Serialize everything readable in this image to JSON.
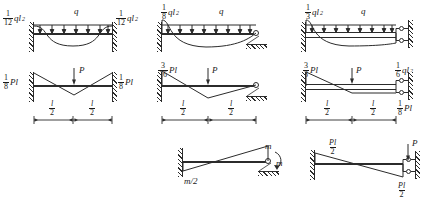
{
  "figure": {
    "ink_color": "#2b2b2b",
    "background": "#ffffff"
  },
  "panels": [
    {
      "id": "p1",
      "name": "fixed-fixed-udl",
      "support_left": "fixed-wall",
      "support_right": "fixed-wall",
      "load": {
        "symbol": "q",
        "type": "uniform-distributed"
      },
      "labels": {
        "left_moment": {
          "num": "1",
          "den": "12",
          "sym": "ql",
          "exp": "2"
        },
        "right_moment": {
          "num": "1",
          "den": "12",
          "sym": "ql",
          "exp": "2"
        }
      }
    },
    {
      "id": "p2",
      "name": "fixed-fixed-point-load",
      "support_left": "fixed-wall",
      "support_right": "fixed-wall",
      "load": {
        "symbol": "P",
        "type": "point-load-midspan"
      },
      "labels": {
        "left_moment": {
          "num": "1",
          "den": "8",
          "sym": "Pl",
          "exp": ""
        },
        "right_moment": {
          "num": "1",
          "den": "8",
          "sym": "Pl",
          "exp": ""
        }
      },
      "dimensions": [
        {
          "num": "l",
          "den": "2"
        },
        {
          "num": "l",
          "den": "2"
        }
      ]
    },
    {
      "id": "p3",
      "name": "fixed-pinned-udl",
      "support_left": "fixed-wall",
      "support_right": "pin-roller",
      "load": {
        "symbol": "q",
        "type": "uniform-distributed"
      },
      "labels": {
        "left_moment": {
          "num": "1",
          "den": "8",
          "sym": "ql",
          "exp": "2"
        }
      }
    },
    {
      "id": "p4",
      "name": "fixed-pinned-point-load",
      "support_left": "fixed-wall",
      "support_right": "pin-roller",
      "load": {
        "symbol": "P",
        "type": "point-load-midspan"
      },
      "labels": {
        "left_moment": {
          "num": "3",
          "den": "16",
          "sym": "Pl",
          "exp": ""
        }
      },
      "dimensions": [
        {
          "num": "l",
          "den": "2"
        },
        {
          "num": "l",
          "den": "2"
        }
      ]
    },
    {
      "id": "p5",
      "name": "fixed-guided-udl",
      "support_left": "fixed-wall",
      "support_right": "guided-double-roller",
      "load": {
        "symbol": "q",
        "type": "uniform-distributed"
      },
      "labels": {
        "left_moment": {
          "num": "1",
          "den": "3",
          "sym": "ql",
          "exp": "2"
        },
        "right_moment": {
          "num": "1",
          "den": "6",
          "sym": "ql",
          "exp": "2"
        }
      }
    },
    {
      "id": "p6",
      "name": "fixed-guided-point-load",
      "support_left": "fixed-wall",
      "support_right": "guided-double-roller",
      "load": {
        "symbol": "P",
        "type": "point-load-midspan"
      },
      "labels": {
        "left_moment": {
          "num": "3",
          "den": "8",
          "sym": "Pl",
          "exp": ""
        },
        "right_moment": {
          "num": "1",
          "den": "8",
          "sym": "Pl",
          "exp": ""
        }
      },
      "dimensions": [
        {
          "num": "l",
          "den": "2"
        },
        {
          "num": "l",
          "den": "2"
        }
      ]
    },
    {
      "id": "p7",
      "name": "fixed-pinned-applied-moment",
      "support_left": "fixed-wall",
      "support_right": "pin-roller",
      "load": {
        "symbol": "m",
        "type": "applied-moment-at-end"
      },
      "labels": {
        "left_moment": {
          "text": "m/2"
        },
        "applied_top": {
          "text": "m"
        },
        "applied_curl": {
          "text": "m"
        }
      }
    },
    {
      "id": "p8",
      "name": "fixed-guided-end-point-load",
      "support_left": "fixed-wall",
      "support_right": "guided-double-roller",
      "load": {
        "symbol": "P",
        "type": "point-load-at-end"
      },
      "labels": {
        "left_moment": {
          "num": "Pl",
          "den": "2"
        },
        "right_moment": {
          "num": "Pl",
          "den": "2"
        }
      }
    }
  ]
}
